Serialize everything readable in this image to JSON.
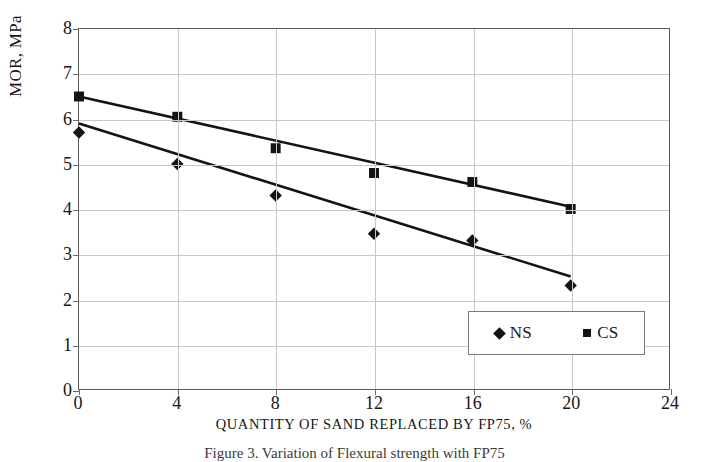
{
  "figure": {
    "caption": "Figure 3.  Variation of Flexural strength with FP75"
  },
  "chart_data": {
    "type": "line",
    "title": "",
    "subtitle": "",
    "xlabel": "QUANTITY OF SAND REPLACED BY FP75, %",
    "ylabel": "MOR, MPa",
    "xlim": [
      0,
      24
    ],
    "ylim": [
      0,
      8
    ],
    "xticks": [
      0,
      4,
      8,
      12,
      16,
      20,
      24
    ],
    "yticks": [
      0,
      1,
      2,
      3,
      4,
      5,
      6,
      7,
      8
    ],
    "xtick_labels": [
      "0",
      "4",
      "8",
      "12",
      "16",
      "20",
      "24"
    ],
    "ytick_labels": [
      "0",
      "1",
      "2",
      "3",
      "4",
      "5",
      "6",
      "7",
      "8"
    ],
    "grid": true,
    "legend_position": "inside-bottom-right",
    "x": [
      0,
      4,
      8,
      12,
      16,
      20
    ],
    "series": [
      {
        "name": "NS",
        "marker": "diamond",
        "color": "#141414",
        "values": [
          5.7,
          5.0,
          4.3,
          3.45,
          3.3,
          2.3
        ],
        "trendline": {
          "y_start": 5.9,
          "y_end": 2.5,
          "x_start": 0,
          "x_end": 20
        }
      },
      {
        "name": "CS",
        "marker": "square",
        "color": "#141414",
        "values": [
          6.5,
          6.05,
          5.35,
          4.8,
          4.6,
          4.0
        ],
        "trendline": {
          "y_start": 6.5,
          "y_end": 4.05,
          "x_start": 0,
          "x_end": 20
        }
      }
    ],
    "legend": [
      {
        "label": "NS",
        "marker": "diamond"
      },
      {
        "label": "CS",
        "marker": "square"
      }
    ]
  }
}
